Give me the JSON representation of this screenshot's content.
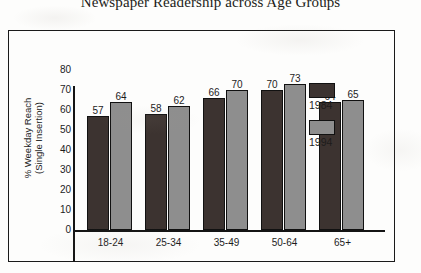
{
  "chart_data": {
    "type": "bar",
    "title": "Newspaper Readership across Age Groups",
    "xlabel": "",
    "ylabel": "% Weekday Reach\n(Single Insertion)",
    "categories": [
      "18-24",
      "25-34",
      "35-49",
      "50-64",
      "65+"
    ],
    "series": [
      {
        "name": "1984",
        "color": "#3c3330",
        "values": [
          57,
          58,
          66,
          70,
          64
        ]
      },
      {
        "name": "1994",
        "color": "#8e8e8e",
        "values": [
          64,
          62,
          70,
          73,
          65
        ]
      }
    ],
    "ylim": [
      0,
      80
    ],
    "yticks": [
      0,
      10,
      20,
      30,
      40,
      50,
      60,
      70,
      80
    ],
    "grid": false,
    "legend_position": "right",
    "data_labels": true
  },
  "legend": {
    "items": [
      {
        "label": "1984"
      },
      {
        "label": "1994"
      }
    ]
  }
}
